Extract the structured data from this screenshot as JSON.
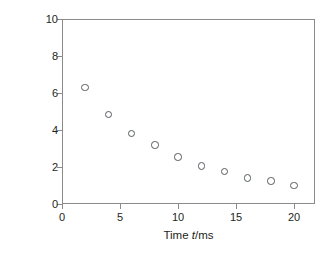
{
  "chart_data": {
    "type": "scatter",
    "title": "",
    "subtitle": "",
    "xlabel": "Time t/ms",
    "ylabel": "[H2O2]t /mol dm-3",
    "x": [
      2,
      4,
      6,
      8,
      10,
      12,
      14,
      16,
      18,
      20
    ],
    "values": [
      6.3,
      4.85,
      3.8,
      3.2,
      2.55,
      2.05,
      1.75,
      1.4,
      1.25,
      1.0
    ],
    "series": [
      {
        "name": "[H2O2]t",
        "x": [
          2,
          4,
          6,
          8,
          10,
          12,
          14,
          16,
          18,
          20
        ],
        "values": [
          6.3,
          4.85,
          3.8,
          3.2,
          2.55,
          2.05,
          1.75,
          1.4,
          1.25,
          1.0
        ]
      }
    ],
    "xlim": [
      0,
      21.8
    ],
    "ylim": [
      0,
      10
    ],
    "xticks": [
      0,
      5,
      10,
      15,
      20
    ],
    "yticks": [
      0,
      2,
      4,
      6,
      8,
      10
    ],
    "xtick_labels": [
      "0",
      "5",
      "10",
      "15",
      "20"
    ],
    "ytick_labels": [
      "0",
      "2",
      "4",
      "6",
      "8",
      "10"
    ],
    "grid": false,
    "legend": false,
    "legend_position": "none",
    "marker": "open-circle",
    "marker_color": "#555a5e",
    "frame_color": "#8a8a8a",
    "background": "#ffffff",
    "annotations": []
  },
  "axes": {
    "x_title_prefix": "Time ",
    "x_title_italic": "t",
    "x_title_suffix": "/ms",
    "y_title_open_bracket": "[H",
    "y_title_sub1": "2",
    "y_title_o": "O",
    "y_title_sub2": "2",
    "y_title_close_bracket": "]",
    "y_title_subt": "t",
    "y_title_units": "/mol dm",
    "y_title_exp": "−3"
  }
}
